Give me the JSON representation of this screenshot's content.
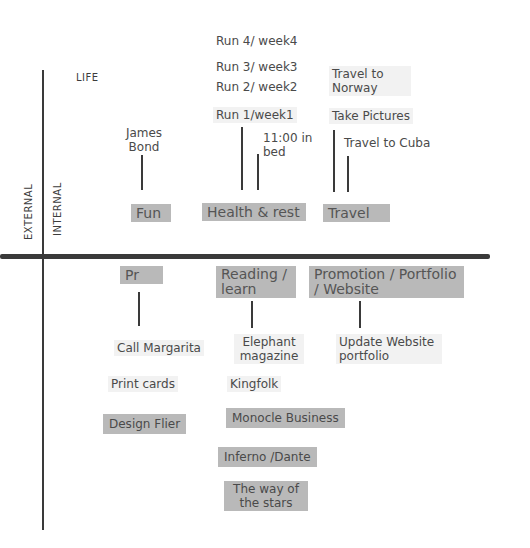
{
  "axes": {
    "top_label": "LIFE",
    "left_outer": "EXTERNAL",
    "left_inner": "INTERNAL"
  },
  "top_categories": [
    {
      "label": "Fun",
      "items": [
        "James Bond"
      ]
    },
    {
      "label": "Health & rest",
      "items": [
        "Run 4/ week4",
        "Run 3/ week3",
        "Run 2/ week2",
        "Run 1/week1",
        "11:00 in bed"
      ]
    },
    {
      "label": "Travel",
      "items": [
        "Travel to Norway",
        "Take Pictures",
        "Travel to Cuba"
      ]
    }
  ],
  "bottom_categories": [
    {
      "label": "Pr",
      "items": [
        "Call Margarita",
        "Print cards",
        "Design Flier"
      ]
    },
    {
      "label": "Reading / learn",
      "items": [
        "Elephant magazine",
        "Kingfolk",
        "Monocle Business",
        "Inferno /Dante",
        "The way of the stars"
      ]
    },
    {
      "label": "Promotion / Portfolio / Website",
      "items": [
        "Update Website portfolio"
      ]
    }
  ],
  "colors": {
    "line": "#3a3a3a",
    "highlight": "#b9b9b9",
    "text": "#4a4a4a"
  }
}
